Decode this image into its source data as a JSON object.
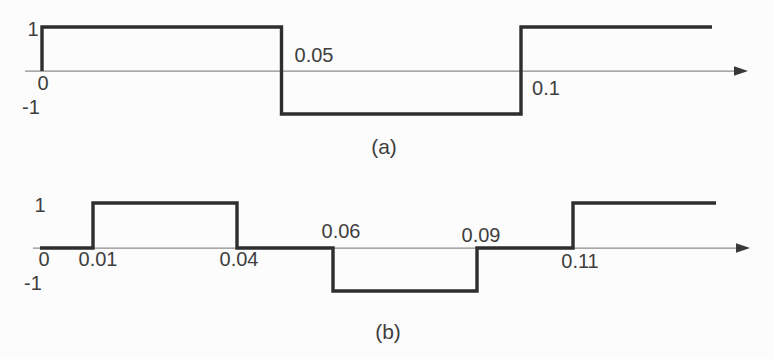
{
  "figure": {
    "background": "#fcfcfc"
  },
  "colors": {
    "wave": "#2e2e2e",
    "axis": "#8d8d8d",
    "arrow": "#383838",
    "text": "#3e3e3e"
  },
  "chart_data": [
    {
      "type": "line",
      "subtype": "square-wave-step",
      "caption": "(a)",
      "ylim": [
        -1,
        1
      ],
      "xlim": [
        0,
        0.147
      ],
      "grid": false,
      "y_tick_labels": [
        {
          "text": "1",
          "value": 1
        },
        {
          "text": "-1",
          "value": -1
        }
      ],
      "x_tick_labels": [
        {
          "text": "0",
          "value": 0,
          "position": "below-axis"
        },
        {
          "text": "0.05",
          "value": 0.05,
          "position": "above-axis"
        },
        {
          "text": "0.1",
          "value": 0.1,
          "position": "below-axis"
        }
      ],
      "segments": [
        {
          "from": 0,
          "to": 0.05,
          "level": 1
        },
        {
          "from": 0.05,
          "to": 0.1,
          "level": -1
        },
        {
          "from": 0.1,
          "to": 0.14,
          "level": 1
        }
      ]
    },
    {
      "type": "line",
      "subtype": "square-wave-step",
      "caption": "(b)",
      "ylim": [
        -1,
        1
      ],
      "xlim": [
        0,
        0.147
      ],
      "grid": false,
      "y_tick_labels": [
        {
          "text": "1",
          "value": 1
        },
        {
          "text": "-1",
          "value": -1
        }
      ],
      "x_tick_labels": [
        {
          "text": "0",
          "value": 0,
          "position": "below-axis"
        },
        {
          "text": "0.01",
          "value": 0.01,
          "position": "below-axis"
        },
        {
          "text": "0.04",
          "value": 0.04,
          "position": "below-axis"
        },
        {
          "text": "0.06",
          "value": 0.06,
          "position": "above-axis"
        },
        {
          "text": "0.09",
          "value": 0.09,
          "position": "above-axis"
        },
        {
          "text": "0.11",
          "value": 0.11,
          "position": "below-axis"
        }
      ],
      "segments": [
        {
          "from": 0,
          "to": 0.01,
          "level": 0
        },
        {
          "from": 0.01,
          "to": 0.04,
          "level": 1
        },
        {
          "from": 0.04,
          "to": 0.06,
          "level": 0
        },
        {
          "from": 0.06,
          "to": 0.09,
          "level": -1
        },
        {
          "from": 0.09,
          "to": 0.11,
          "level": 0
        },
        {
          "from": 0.11,
          "to": 0.14,
          "level": 1
        }
      ]
    }
  ]
}
